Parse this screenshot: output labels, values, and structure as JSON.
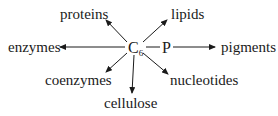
{
  "diagram": {
    "center": {
      "label": "C",
      "subscript": "6",
      "link": "P"
    },
    "products": [
      {
        "label": "proteins"
      },
      {
        "label": "lipids"
      },
      {
        "label": "enzymes"
      },
      {
        "label": "pigments"
      },
      {
        "label": "coenzymes"
      },
      {
        "label": "nucleotides"
      },
      {
        "label": "cellulose"
      }
    ]
  }
}
